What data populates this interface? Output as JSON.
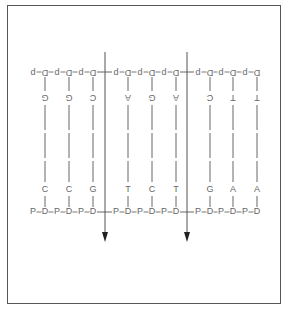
{
  "top_strand": {
    "label": "upper backbone (inverted)",
    "backbone_text": [
      "p",
      "D",
      "p",
      "D",
      "p",
      "D",
      "p",
      "D",
      "p",
      "D",
      "p",
      "D",
      "p",
      "D",
      "p",
      "D",
      "p",
      "D"
    ],
    "bases": [
      "G",
      "G",
      "C",
      "A",
      "G",
      "A",
      "C",
      "T",
      "T"
    ]
  },
  "bottom_strand": {
    "label": "lower backbone",
    "backbone_text": [
      "P",
      "D",
      "P",
      "D",
      "P",
      "D",
      "P",
      "D",
      "P",
      "D",
      "P",
      "D",
      "P",
      "D",
      "P",
      "D",
      "P",
      "D"
    ],
    "bases": [
      "C",
      "C",
      "G",
      "T",
      "C",
      "T",
      "G",
      "A",
      "A"
    ]
  },
  "cut_sites": [
    {
      "after_base_index": 2,
      "direction": "down",
      "icon": "arrow-down-icon"
    },
    {
      "after_base_index": 5,
      "direction": "down",
      "icon": "arrow-down-icon"
    }
  ],
  "colors": {
    "text": "#666666",
    "line": "#555555",
    "frame": "#555555"
  }
}
